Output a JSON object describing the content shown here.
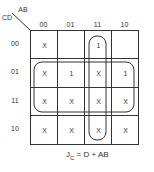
{
  "kmap": {
    "corner": {
      "col_var": "AB",
      "row_var": "CD"
    },
    "col_headers": [
      "00",
      "01",
      "11",
      "10"
    ],
    "row_headers": [
      "00",
      "01",
      "11",
      "10"
    ],
    "cells": [
      [
        "X",
        "",
        "1",
        ""
      ],
      [
        "X",
        "1",
        "X",
        "1"
      ],
      [
        "X",
        "X",
        "X",
        "X"
      ],
      [
        "X",
        "X",
        "X",
        "X"
      ]
    ],
    "groups": [
      {
        "name": "D",
        "rows": [
          "01",
          "11"
        ],
        "cols": [
          "00",
          "01",
          "11",
          "10"
        ]
      },
      {
        "name": "AB",
        "rows": [
          "00",
          "01",
          "11",
          "10"
        ],
        "cols": [
          "11"
        ]
      }
    ]
  },
  "equation": {
    "lhs": "J",
    "lhs_sub": "C",
    "rhs": " = D + AB"
  }
}
